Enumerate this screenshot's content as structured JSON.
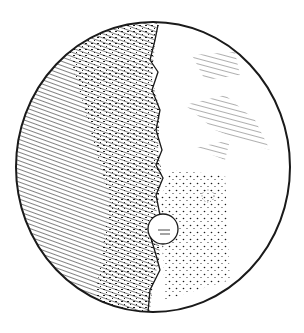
{
  "image": {
    "subject": "Engraved drawing of the Moon (half illuminated)",
    "style": "black ink hatching and stippling on white",
    "colors": {
      "ink": "#1a1a1a",
      "paper": "#ffffff"
    },
    "features": [
      "hatched dark left hemisphere",
      "jagged terminator line",
      "large round crater near lower terminator",
      "dark hatched patches on right",
      "stippled lower-right region"
    ]
  }
}
